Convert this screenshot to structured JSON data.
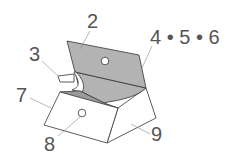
{
  "diagram": {
    "colors": {
      "flap_fill": "#b3b3b3",
      "panel_fill": "#ffffff",
      "stroke": "#333333",
      "leader": "#888888",
      "label": "#555555"
    },
    "labels": {
      "part_2": "2",
      "part_3": "3",
      "part_4_5_6": "4 • 5 • 6",
      "part_7": "7",
      "part_8": "8",
      "part_9": "9"
    }
  }
}
